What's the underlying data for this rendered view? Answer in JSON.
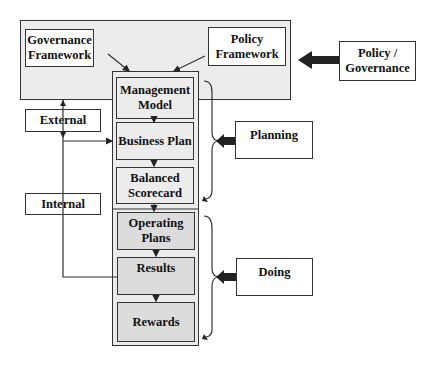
{
  "diagram": {
    "top_container": {
      "governance_framework": "Governance Framework",
      "policy_framework": "Policy Framework"
    },
    "policy_governance": "Policy / Governance",
    "pipeline": [
      {
        "label": "Management Model",
        "phase": "planning"
      },
      {
        "label": "Business Plan",
        "phase": "planning"
      },
      {
        "label": "Balanced Scorecard",
        "phase": "planning"
      },
      {
        "label": "Operating Plans",
        "phase": "doing"
      },
      {
        "label": "Results",
        "phase": "doing"
      },
      {
        "label": "Rewards",
        "phase": "doing"
      }
    ],
    "side_labels": {
      "external": "External",
      "internal": "Internal"
    },
    "phases": {
      "planning": "Planning",
      "doing": "Doing"
    },
    "colors": {
      "outline": "#333333",
      "planning_fill": "#ececec",
      "doing_fill": "#dcdcdc",
      "arrow_fill": "#222222"
    }
  }
}
